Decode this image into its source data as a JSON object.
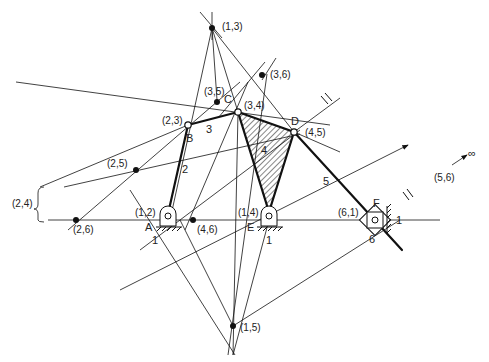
{
  "diagram": {
    "type": "kinematic-linkage-instant-centers",
    "stroke_color": "#111111",
    "background": "#ffffff"
  },
  "joints": {
    "A": "A",
    "B": "B",
    "C": "C",
    "D": "D",
    "E": "E",
    "F": "F"
  },
  "links": {
    "l1a": "1",
    "l1b": "1",
    "l1c": "1",
    "l2": "2",
    "l3": "3",
    "l4": "4",
    "l5": "5",
    "l6": "6"
  },
  "instant_centers": {
    "c13": "(1,3)",
    "c36": "(3,6)",
    "c35": "(3,5)",
    "c34": "(3,4)",
    "c23": "(2,3)",
    "c45": "(4,5)",
    "c25": "(2,5)",
    "c24": "(2,4)",
    "c26": "(2,6)",
    "c12": "(1,2)",
    "c46": "(4,6)",
    "c14": "(1,4)",
    "c61": "(6,1)",
    "c56": "(5,6)",
    "c15": "(1,5)"
  },
  "annotations": {
    "infinity": "∞"
  }
}
